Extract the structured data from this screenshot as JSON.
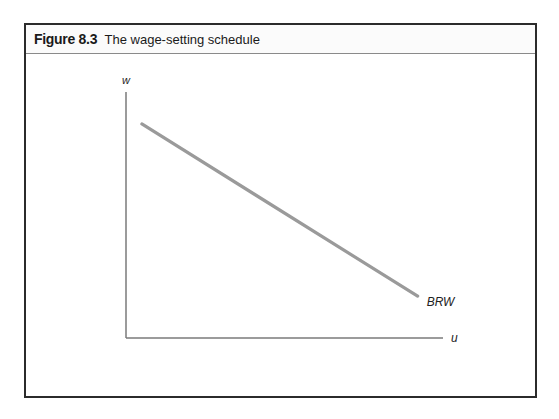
{
  "figure": {
    "number_label": "Figure 8.3",
    "caption": "The wage-setting schedule"
  },
  "chart_data": {
    "type": "line",
    "title": "The wage-setting schedule",
    "xlabel": "u",
    "ylabel": "w",
    "xlim": [
      0,
      1
    ],
    "ylim": [
      0,
      1
    ],
    "grid": false,
    "ticks": false,
    "series": [
      {
        "name": "BRW",
        "label": "BRW",
        "color": "#9a9a9a",
        "points": [
          [
            0.05,
            0.87
          ],
          [
            0.92,
            0.17
          ]
        ]
      }
    ]
  }
}
